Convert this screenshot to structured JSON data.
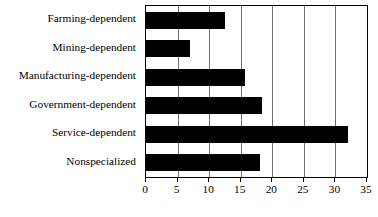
{
  "chart_data": {
    "type": "bar",
    "orientation": "horizontal",
    "title": "",
    "xlabel": "",
    "ylabel": "",
    "categories": [
      "Farming-dependent",
      "Mining-dependent",
      "Manufacturing-dependent",
      "Government-dependent",
      "Service-dependent",
      "Nonspecialized"
    ],
    "values": [
      12.5,
      7.0,
      15.7,
      18.4,
      32.0,
      18.0
    ],
    "xlim": [
      0,
      35
    ],
    "xticks": [
      0,
      5,
      10,
      15,
      20,
      25,
      30,
      35
    ],
    "xtick_labels": [
      "0",
      "5",
      "10",
      "15",
      "20",
      "25",
      "30",
      "35"
    ],
    "grid": "vertical",
    "legend": "none",
    "bar_color": "#000000",
    "plot_border_color": "#000000",
    "gridline_color": "#6e6e6e",
    "background_color": "#ffffff"
  }
}
